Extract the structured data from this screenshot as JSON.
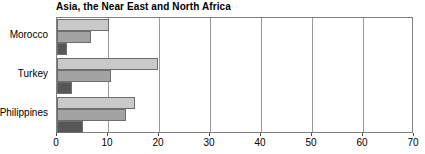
{
  "chart_data": {
    "type": "bar",
    "orientation": "horizontal",
    "title": "Asia, the Near East and North Africa",
    "xlabel": "",
    "ylabel": "",
    "categories": [
      "Morocco",
      "Turkey",
      "Philippines"
    ],
    "series": [
      {
        "name": "series-1",
        "color": "#c9c9c9",
        "values": [
          10.2,
          19.8,
          15.3
        ]
      },
      {
        "name": "series-2",
        "color": "#a3a3a3",
        "values": [
          6.7,
          10.6,
          13.6
        ]
      },
      {
        "name": "series-3",
        "color": "#575757",
        "values": [
          2.0,
          3.0,
          5.0
        ]
      }
    ],
    "xlim": [
      0,
      70
    ],
    "xticks": [
      0,
      10,
      20,
      30,
      40,
      50,
      60,
      70
    ],
    "xticklabels": [
      "0",
      "10",
      "20",
      "30",
      "40",
      "50",
      "60",
      "70"
    ],
    "grid": "vertical",
    "legend": "none",
    "bar_border_color": "#6e6e6e",
    "gridline_color": "#9a9a9a",
    "plot_border_color": "#808080",
    "background": "#ffffff"
  }
}
